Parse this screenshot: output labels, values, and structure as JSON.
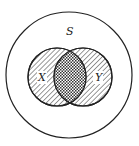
{
  "diagram": {
    "type": "venn",
    "universe_label": "S",
    "sets": [
      {
        "label": "X",
        "shading": "diagonal-hatch"
      },
      {
        "label": "Y",
        "shading": "diagonal-hatch"
      }
    ],
    "intersection_shading": "crosshatch",
    "colors": {
      "stroke": "#222222",
      "background": "#ffffff"
    }
  }
}
